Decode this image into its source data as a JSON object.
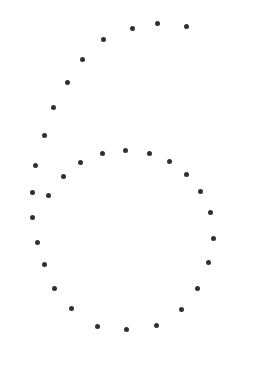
{
  "canvas": {
    "width": 260,
    "height": 365,
    "background_color": "#ffffff"
  },
  "figure": {
    "name": "dotted-digit-six",
    "dot_color": "#2f2f36",
    "dot_diameter": 5
  },
  "chart_data": {
    "type": "scatter",
    "title": "",
    "subtitle": "",
    "xlabel": "",
    "ylabel": "",
    "xlim": [
      0,
      260
    ],
    "ylim": [
      0,
      365
    ],
    "grid": false,
    "legend": false,
    "axes_visible": false,
    "marker": "circle",
    "marker_size": 5,
    "marker_color": "#2f2f36",
    "series": [
      {
        "name": "stem",
        "color": "#2f2f36",
        "points": [
          [
            186,
            26
          ],
          [
            157,
            23
          ],
          [
            132,
            28
          ],
          [
            103,
            39
          ],
          [
            82,
            59
          ],
          [
            67,
            82
          ],
          [
            53,
            107
          ],
          [
            44,
            135
          ],
          [
            35,
            165
          ]
        ]
      },
      {
        "name": "bowl",
        "color": "#2f2f36",
        "points": [
          [
            102,
            153
          ],
          [
            125,
            150
          ],
          [
            149,
            153
          ],
          [
            169,
            161
          ],
          [
            186,
            174
          ],
          [
            200,
            191
          ],
          [
            210,
            212
          ],
          [
            213,
            238
          ],
          [
            208,
            262
          ],
          [
            197,
            288
          ],
          [
            181,
            309
          ],
          [
            156,
            325
          ],
          [
            126,
            329
          ],
          [
            97,
            326
          ],
          [
            71,
            308
          ],
          [
            54,
            288
          ],
          [
            44,
            264
          ],
          [
            37,
            242
          ],
          [
            32,
            217
          ],
          [
            32,
            192
          ],
          [
            48,
            195
          ],
          [
            63,
            176
          ],
          [
            80,
            162
          ]
        ]
      }
    ]
  }
}
